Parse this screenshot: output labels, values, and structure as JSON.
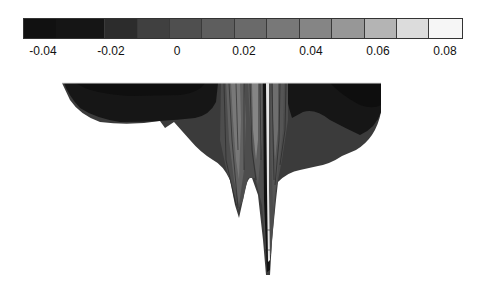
{
  "chart_data": {
    "type": "heatmap",
    "subtype": "filled-contour",
    "title": "",
    "xlabel": "",
    "ylabel": "",
    "colorbar": {
      "orientation": "horizontal",
      "position": "top",
      "range": [
        -0.05,
        0.085
      ],
      "tick_labels": [
        "-0.04",
        "-0.02",
        "0",
        "0.02",
        "0.04",
        "0.06",
        "0.08"
      ],
      "tick_values": [
        -0.04,
        -0.02,
        0,
        0.02,
        0.04,
        0.06,
        0.08
      ],
      "levels": [
        {
          "from": -0.05,
          "to": -0.04,
          "color": "#111111"
        },
        {
          "from": -0.04,
          "to": -0.025,
          "color": "#151515"
        },
        {
          "from": -0.025,
          "to": -0.015,
          "color": "#2c2c2c"
        },
        {
          "from": -0.015,
          "to": -0.005,
          "color": "#404040"
        },
        {
          "from": -0.005,
          "to": 0.005,
          "color": "#4f4f4f"
        },
        {
          "from": 0.005,
          "to": 0.015,
          "color": "#5e5e5e"
        },
        {
          "from": 0.015,
          "to": 0.025,
          "color": "#6a6a6a"
        },
        {
          "from": 0.025,
          "to": 0.035,
          "color": "#787878"
        },
        {
          "from": 0.035,
          "to": 0.045,
          "color": "#858585"
        },
        {
          "from": 0.045,
          "to": 0.055,
          "color": "#979797"
        },
        {
          "from": 0.055,
          "to": 0.065,
          "color": "#b4b4b4"
        },
        {
          "from": 0.065,
          "to": 0.075,
          "color": "#dcdcdc"
        },
        {
          "from": 0.075,
          "to": 0.085,
          "color": "#f6f6f6"
        }
      ]
    },
    "field_description": "Inverted-dome contour field; darkest values (~-0.04) in upper left and right lobes, mid-gray (~-0.01) band along lower rim, narrow vertical high-value streaks (up to ~0.08) near center column with two downward spikes",
    "grid": false,
    "legend": "none"
  }
}
